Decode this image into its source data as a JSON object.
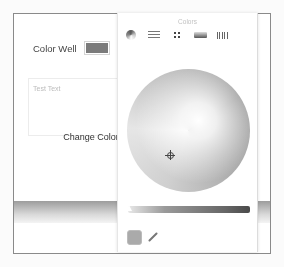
{
  "main_window": {
    "color_well_label": "Color Well",
    "color_well_value": "#7b7b7b",
    "text_area_placeholder": "Test Text",
    "change_color_button": "Change Color"
  },
  "colors_panel": {
    "title": "Colors",
    "toolbar": [
      {
        "name": "color-wheel",
        "icon": "color-wheel-icon",
        "selected": true
      },
      {
        "name": "color-sliders",
        "icon": "sliders-icon"
      },
      {
        "name": "color-palettes",
        "icon": "palette-icon"
      },
      {
        "name": "image-palettes",
        "icon": "image-palette-icon"
      },
      {
        "name": "pencils",
        "icon": "pencils-icon"
      }
    ],
    "current_color": "#aaaaaa",
    "eyedropper": "eyedropper-icon"
  }
}
